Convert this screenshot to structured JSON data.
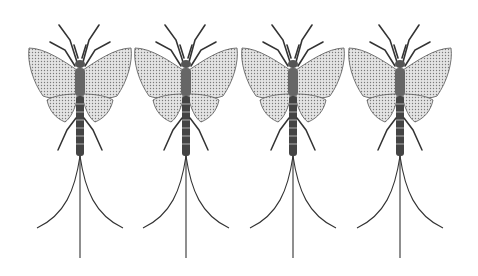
{
  "image": {
    "subject": "Engraved illustration of four mayflies arranged in a row",
    "background": "#ffffff",
    "ink": "#2a2a2a",
    "wing_fill": "#d8d8d8",
    "count": 4
  },
  "insects": [
    {
      "label": "mayfly-1",
      "center_x": 80
    },
    {
      "label": "mayfly-2",
      "center_x": 186
    },
    {
      "label": "mayfly-3",
      "center_x": 293
    },
    {
      "label": "mayfly-4",
      "center_x": 400
    }
  ]
}
